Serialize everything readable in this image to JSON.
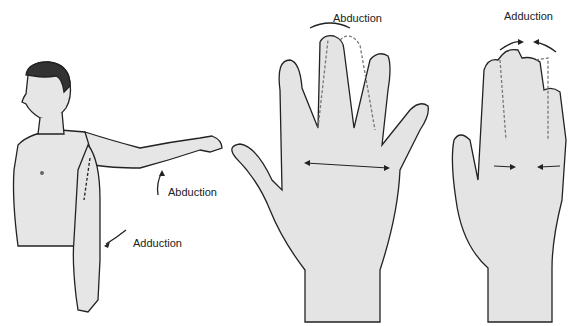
{
  "figure": {
    "panels": [
      {
        "id": "arm",
        "description": "Man with arm abducted at shoulder",
        "labels": {
          "upper": "Abduction",
          "lower": "Adduction"
        }
      },
      {
        "id": "hand-abduction",
        "description": "Open hand with fingers spread",
        "labels": {
          "top": "Abduction"
        }
      },
      {
        "id": "hand-adduction",
        "description": "Open hand with fingers together",
        "labels": {
          "top": "Adduction"
        }
      }
    ],
    "colors": {
      "skin_fill": "#e4e4e4",
      "outline": "#222222",
      "hair": "#333333"
    }
  }
}
